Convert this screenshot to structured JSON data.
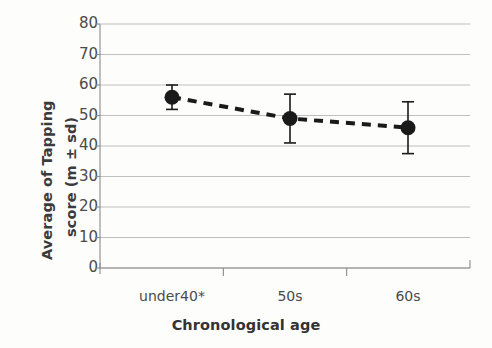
{
  "chart_data": {
    "type": "line",
    "title": "",
    "xlabel": "Chronological age",
    "ylabel": "Average of Tapping score (m ± sd)",
    "ylabel_line1": "Average of Tapping",
    "ylabel_line2": "score (m ± sd)",
    "categories": [
      "under40*",
      "50s",
      "60s"
    ],
    "values": [
      56,
      49,
      46
    ],
    "errors": [
      4,
      8,
      8.5
    ],
    "yticks": [
      0,
      10,
      20,
      30,
      40,
      50,
      60,
      70,
      80
    ],
    "ylim": [
      0,
      80
    ],
    "grid": true,
    "legend": false,
    "series": [
      {
        "name": "Tapping score",
        "values": [
          56,
          49,
          46
        ],
        "errors": [
          4,
          8,
          8.5
        ],
        "line_style": "dashed",
        "marker": "circle",
        "color": "#1a1a1a"
      }
    ],
    "annotations": [
      "* denotes under40 group"
    ]
  },
  "style": {
    "marker_color": "#1a1a1a",
    "line_color": "#1a1a1a",
    "grid_color": "#b8b8b8",
    "axis_color": "#8a8a8a",
    "text_color": "#4a4a4a",
    "background": "#fdfdfc"
  },
  "geometry": {
    "plot_left": 100,
    "plot_right": 470,
    "plot_top": 24,
    "plot_bottom": 268,
    "point_x": [
      172,
      290,
      408
    ]
  }
}
